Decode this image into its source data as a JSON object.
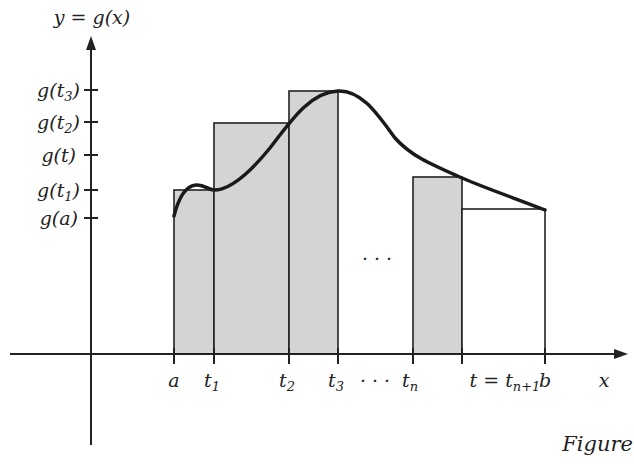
{
  "figure": {
    "caption": "Figure",
    "function_label": "y = g(x)",
    "x_axis_label": "x",
    "ellipsis_middle": "· · ·",
    "ellipsis_axis": "· · ·"
  },
  "y_ticks": [
    {
      "base": "g(t",
      "sub": "3",
      "close": ")",
      "y": 90
    },
    {
      "base": "g(t",
      "sub": "2",
      "close": ")",
      "y": 122
    },
    {
      "base": "g(t)",
      "sub": "",
      "close": "",
      "y": 155
    },
    {
      "base": "g(t",
      "sub": "1",
      "close": ")",
      "y": 190
    },
    {
      "base": "g(a)",
      "sub": "",
      "close": "",
      "y": 218
    }
  ],
  "x_ticks": [
    {
      "base": "a",
      "sub": "",
      "x": 174
    },
    {
      "base": "t",
      "sub": "1",
      "x": 214
    },
    {
      "base": "t",
      "sub": "2",
      "x": 289
    },
    {
      "base": "t",
      "sub": "3",
      "x": 338
    },
    {
      "base": "t",
      "sub": "n",
      "x": 413
    },
    {
      "base": "t = t",
      "sub": "n+1",
      "x": 462
    },
    {
      "base": "b",
      "sub": "",
      "x": 545
    }
  ],
  "rectangles": [
    {
      "from": "a",
      "to": "t1",
      "height_label": "g(t1)",
      "shaded": true
    },
    {
      "from": "t1",
      "to": "t2",
      "height_label": "g(t2)",
      "shaded": true
    },
    {
      "from": "t2",
      "to": "t3",
      "height_label": "g(t3)",
      "shaded": true
    },
    {
      "from": "tn",
      "to": "t",
      "height_label": "g(t)",
      "shaded": true
    },
    {
      "from": "t",
      "to": "b",
      "height_label": "g(b)",
      "shaded": false
    }
  ],
  "colors": {
    "shade": "#d4d4d4",
    "ink": "#222222",
    "background": "#ffffff"
  }
}
